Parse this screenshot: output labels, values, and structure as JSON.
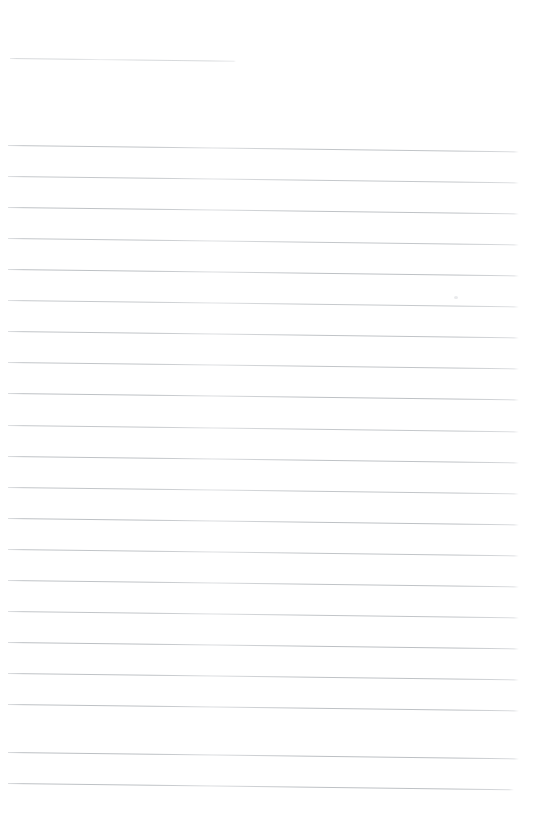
{
  "document": {
    "kind": "scanned-ruled-paper",
    "title": "Blank lined notebook page",
    "page_width": 542,
    "page_height": 831,
    "background_color": "#ffffff",
    "content_text": "",
    "visible_text_present": false
  },
  "ruling": {
    "line_color": "#b6babe",
    "line_color_faint": "#d8dadd",
    "line_thickness_px": 1,
    "line_spacing_px": 31,
    "skew_degrees": 0.72,
    "left_margin_px": 8,
    "right_edge_px": 518,
    "total_lines": 22,
    "full_width_lines": 21,
    "short_lines": 1
  },
  "lines": [
    {
      "id": 1,
      "y": 58,
      "x_start": 10,
      "x_end": 236,
      "kind": "short",
      "opacity": 0.55
    },
    {
      "id": 2,
      "y": 145,
      "x_start": 8,
      "x_end": 519,
      "kind": "full-width",
      "opacity": 0.85
    },
    {
      "id": 3,
      "y": 176,
      "x_start": 8,
      "x_end": 519,
      "kind": "full-width",
      "opacity": 0.8
    },
    {
      "id": 4,
      "y": 207,
      "x_start": 8,
      "x_end": 519,
      "kind": "full-width",
      "opacity": 0.88
    },
    {
      "id": 5,
      "y": 238,
      "x_start": 8,
      "x_end": 519,
      "kind": "full-width",
      "opacity": 0.82
    },
    {
      "id": 6,
      "y": 269,
      "x_start": 8,
      "x_end": 519,
      "kind": "full-width",
      "opacity": 0.9
    },
    {
      "id": 7,
      "y": 300,
      "x_start": 8,
      "x_end": 519,
      "kind": "full-width",
      "opacity": 0.78
    },
    {
      "id": 8,
      "y": 331,
      "x_start": 8,
      "x_end": 519,
      "kind": "full-width",
      "opacity": 0.86
    },
    {
      "id": 9,
      "y": 362,
      "x_start": 8,
      "x_end": 519,
      "kind": "full-width",
      "opacity": 0.84
    },
    {
      "id": 10,
      "y": 393,
      "x_start": 8,
      "x_end": 519,
      "kind": "full-width",
      "opacity": 0.9
    },
    {
      "id": 11,
      "y": 425,
      "x_start": 8,
      "x_end": 519,
      "kind": "full-width",
      "opacity": 0.8
    },
    {
      "id": 12,
      "y": 456,
      "x_start": 8,
      "x_end": 519,
      "kind": "full-width",
      "opacity": 0.88
    },
    {
      "id": 13,
      "y": 487,
      "x_start": 8,
      "x_end": 519,
      "kind": "full-width",
      "opacity": 0.83
    },
    {
      "id": 14,
      "y": 518,
      "x_start": 8,
      "x_end": 519,
      "kind": "full-width",
      "opacity": 0.9
    },
    {
      "id": 15,
      "y": 549,
      "x_start": 8,
      "x_end": 519,
      "kind": "full-width",
      "opacity": 0.85
    },
    {
      "id": 16,
      "y": 580,
      "x_start": 8,
      "x_end": 519,
      "kind": "full-width",
      "opacity": 0.87
    },
    {
      "id": 17,
      "y": 611,
      "x_start": 8,
      "x_end": 519,
      "kind": "full-width",
      "opacity": 0.84
    },
    {
      "id": 18,
      "y": 642,
      "x_start": 8,
      "x_end": 519,
      "kind": "full-width",
      "opacity": 0.92
    },
    {
      "id": 19,
      "y": 673,
      "x_start": 8,
      "x_end": 519,
      "kind": "full-width",
      "opacity": 0.88
    },
    {
      "id": 20,
      "y": 704,
      "x_start": 8,
      "x_end": 519,
      "kind": "full-width",
      "opacity": 0.9
    },
    {
      "id": 21,
      "y": 752,
      "x_start": 8,
      "x_end": 519,
      "kind": "full-width",
      "opacity": 0.92
    },
    {
      "id": 22,
      "y": 783,
      "x_start": 8,
      "x_end": 514,
      "kind": "full-width",
      "opacity": 0.9
    }
  ],
  "artifacts": [
    {
      "id": "scan-speck",
      "name": "scanner-speck",
      "x": 454,
      "y": 296,
      "width": 4,
      "height": 3,
      "color": "#e9eaec"
    }
  ]
}
